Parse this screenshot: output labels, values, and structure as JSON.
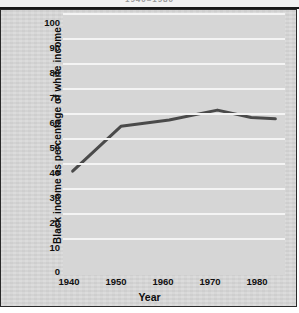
{
  "figure": {
    "title_partial": "1940–1980",
    "background_color": "#d9d9d9",
    "plot_background_color": "#d6d6d6",
    "gridline_color": "#f4f4f4",
    "line_color": "#4a4a4a",
    "frame_color": "#2a2a2a"
  },
  "chart_data": {
    "type": "line",
    "title": "1940–1980",
    "xlabel": "Year",
    "ylabel": "Black income as  percentage of white income",
    "x": [
      1940,
      1950,
      1960,
      1970,
      1977,
      1982
    ],
    "values": [
      36.5,
      54.5,
      57.0,
      61.0,
      58.0,
      57.5
    ],
    "series": [
      {
        "name": "Black income as percentage of white income",
        "values": [
          36.5,
          54.5,
          57.0,
          61.0,
          58.0,
          57.5
        ]
      }
    ],
    "xlim": [
      1938,
      1984
    ],
    "ylim": [
      0,
      100
    ],
    "xticks": [
      1940,
      1950,
      1960,
      1970,
      1980
    ],
    "xtick_labels": [
      "1940",
      "1950",
      "1960",
      "1970",
      "1980"
    ],
    "yticks": [
      0,
      10,
      20,
      30,
      40,
      50,
      60,
      70,
      80,
      90,
      100
    ],
    "ytick_labels": [
      "0",
      "10",
      "20",
      "30",
      "40",
      "50",
      "60",
      "70",
      "80",
      "90",
      "100"
    ],
    "grid": "horizontal",
    "legend": "none",
    "markers": "none",
    "line_width": 3
  }
}
